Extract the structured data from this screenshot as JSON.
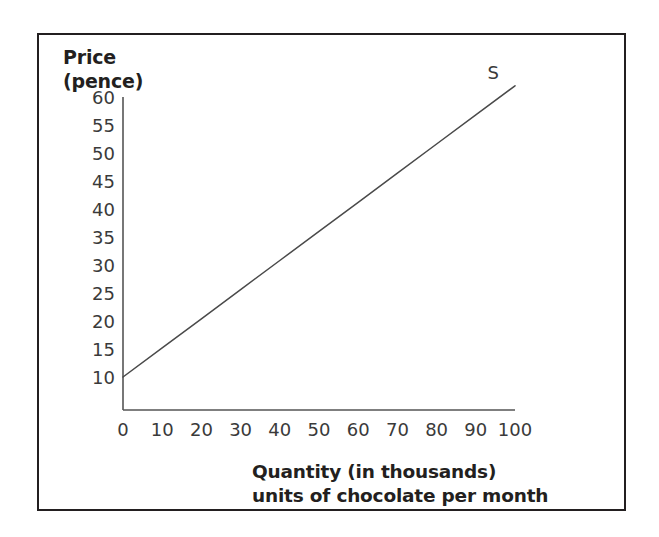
{
  "figure": {
    "background_color": "#ffffff",
    "border_color": "#231f20",
    "axis_color": "#555555",
    "line_color": "#4a4a4a",
    "text_color": "#231f20"
  },
  "chart_data": {
    "type": "line",
    "title": "",
    "ylabel": "Price\n(pence)",
    "ylabel_line1": "Price",
    "ylabel_line2": "(pence)",
    "xlabel": "Quantity (in thousands)\nunits of chocolate per month",
    "xlabel_line1": "Quantity (in thousands)",
    "xlabel_line2": "units of chocolate per month",
    "xlim": [
      0,
      105
    ],
    "ylim": [
      0,
      62
    ],
    "xticks": [
      0,
      10,
      20,
      30,
      40,
      50,
      60,
      70,
      80,
      90,
      100
    ],
    "yticks": [
      10,
      15,
      20,
      25,
      30,
      35,
      40,
      45,
      50,
      55,
      60
    ],
    "grid": false,
    "legend_position": "inline-end-of-line",
    "series": [
      {
        "name": "S",
        "label": "S",
        "description": "supply curve",
        "x": [
          0,
          10,
          20,
          30,
          40,
          50,
          60,
          70,
          80,
          90,
          100
        ],
        "values": [
          10,
          15.2,
          20.4,
          25.6,
          30.8,
          36,
          41.2,
          46.4,
          51.6,
          56.8,
          62
        ]
      }
    ],
    "annotations": [
      {
        "text": "S",
        "x": 95,
        "y": 63
      }
    ]
  }
}
